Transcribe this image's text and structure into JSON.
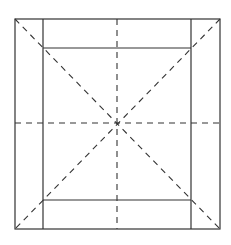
{
  "diagram": {
    "width": 231,
    "height": 245,
    "stroke_color": "#333333",
    "background": "#ffffff",
    "outer_square": {
      "x1": 15,
      "y1": 19,
      "x2": 220,
      "y2": 229
    },
    "inner_square": {
      "x1": 43,
      "y1": 48,
      "x2": 191,
      "y2": 200
    },
    "center": {
      "x": 117,
      "y": 123
    }
  }
}
